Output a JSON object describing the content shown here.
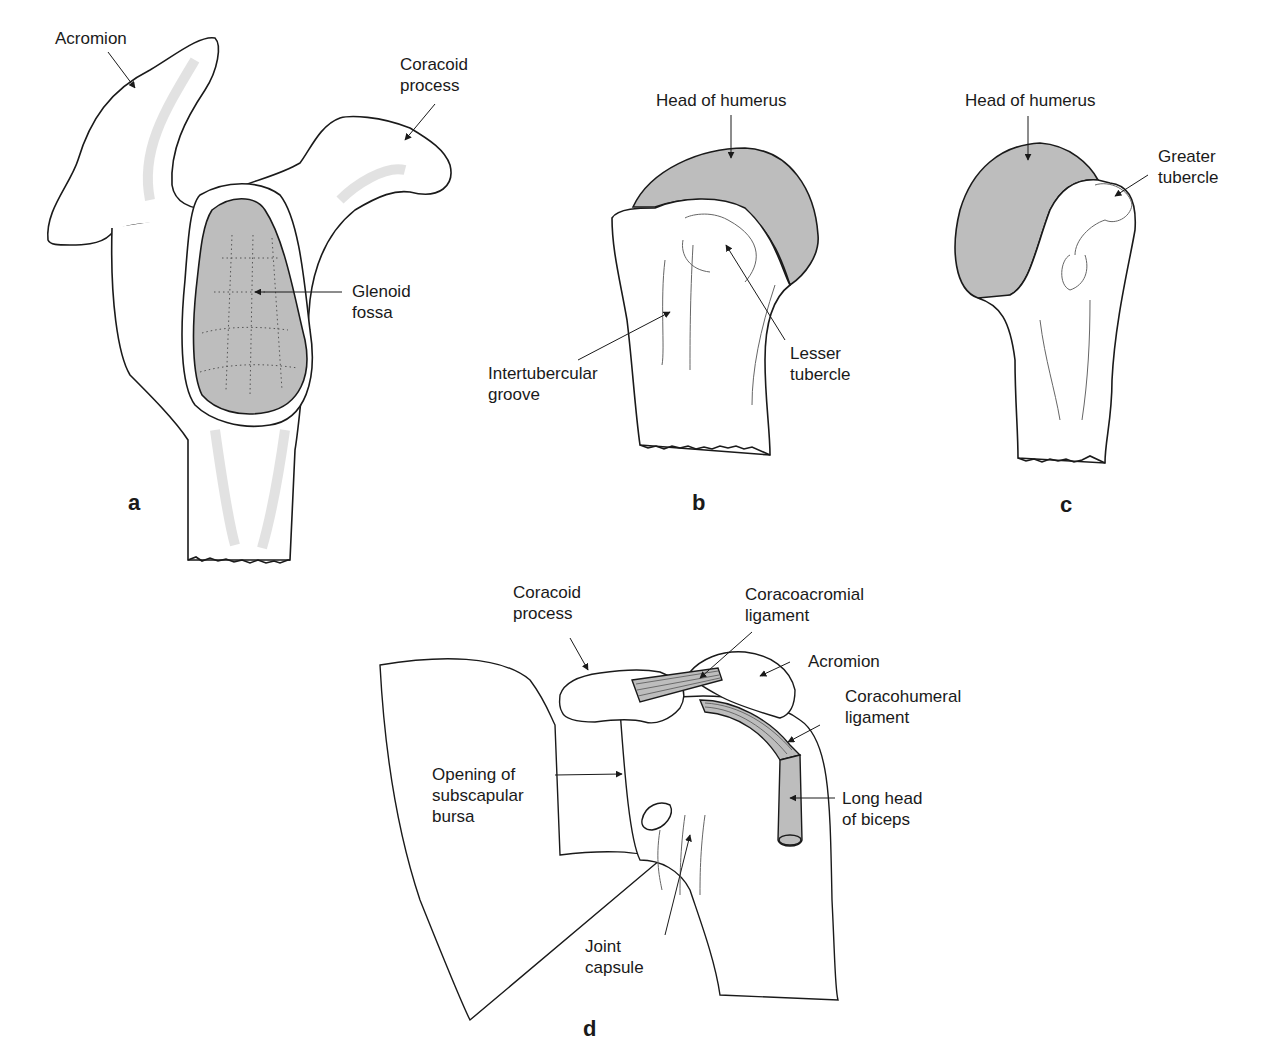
{
  "figure": {
    "panels": [
      {
        "id": "a",
        "letter": "a",
        "labels": {
          "acromion": "Acromion",
          "coracoid": "Coracoid\nprocess",
          "glenoid": "Glenoid\nfossa"
        }
      },
      {
        "id": "b",
        "letter": "b",
        "labels": {
          "head": "Head of humerus",
          "intertubercular": "Intertubercular\ngroove",
          "lesser": "Lesser\ntubercle"
        }
      },
      {
        "id": "c",
        "letter": "c",
        "labels": {
          "head": "Head of humerus",
          "greater": "Greater\ntubercle"
        }
      },
      {
        "id": "d",
        "letter": "d",
        "labels": {
          "coracoid": "Coracoid\nprocess",
          "coracoacromial": "Coracoacromial\nligament",
          "acromion": "Acromion",
          "coracohumeral": "Coracohumeral\nligament",
          "subscapular": "Opening of\nsubscapular\nbursa",
          "biceps": "Long head\nof biceps",
          "capsule": "Joint\ncapsule"
        }
      }
    ],
    "colors": {
      "outline": "#1a1a1a",
      "articular_fill": "#bdbdbd",
      "shade": "#e6e6e6",
      "background": "#ffffff"
    }
  }
}
